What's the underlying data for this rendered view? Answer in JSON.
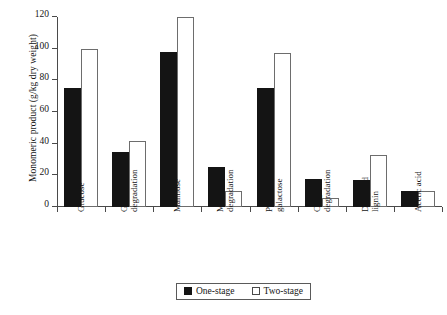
{
  "chart_data": {
    "type": "bar",
    "title": "",
    "xlabel": "",
    "ylabel": "Monomeric product (g/kg dry weight)",
    "ylim": [
      0,
      120
    ],
    "yticks": [
      0,
      20,
      40,
      60,
      80,
      100,
      120
    ],
    "grid": false,
    "legend_position": "bottom-center",
    "categories": [
      "Glucose",
      "Glucose degradation",
      "Mannose",
      "Mannose degradation",
      "Pentose + galactose",
      "CS/gal degradation",
      "Degraded lignin",
      "Acetic acid"
    ],
    "category_lines": [
      [
        "Glucose"
      ],
      [
        "Glucose",
        "degradation"
      ],
      [
        "Mannose"
      ],
      [
        "Mannose",
        "degradation"
      ],
      [
        "Pentose +",
        "galactose"
      ],
      [
        "CS/gal",
        "degradation"
      ],
      [
        "Degraded",
        "lignin"
      ],
      [
        "Acetic acid"
      ]
    ],
    "series": [
      {
        "name": "One-stage",
        "color": "#141414",
        "style": "filled",
        "values": [
          75,
          35,
          98,
          25,
          75,
          18,
          17,
          10
        ]
      },
      {
        "name": "Two-stage",
        "color": "#ffffff",
        "style": "hollow",
        "values": [
          100,
          42,
          120,
          10,
          97,
          6,
          33,
          10
        ]
      }
    ]
  },
  "legend": {
    "entries": [
      {
        "label": "One-stage",
        "style": "filled"
      },
      {
        "label": "Two-stage",
        "style": "hollow"
      }
    ]
  }
}
